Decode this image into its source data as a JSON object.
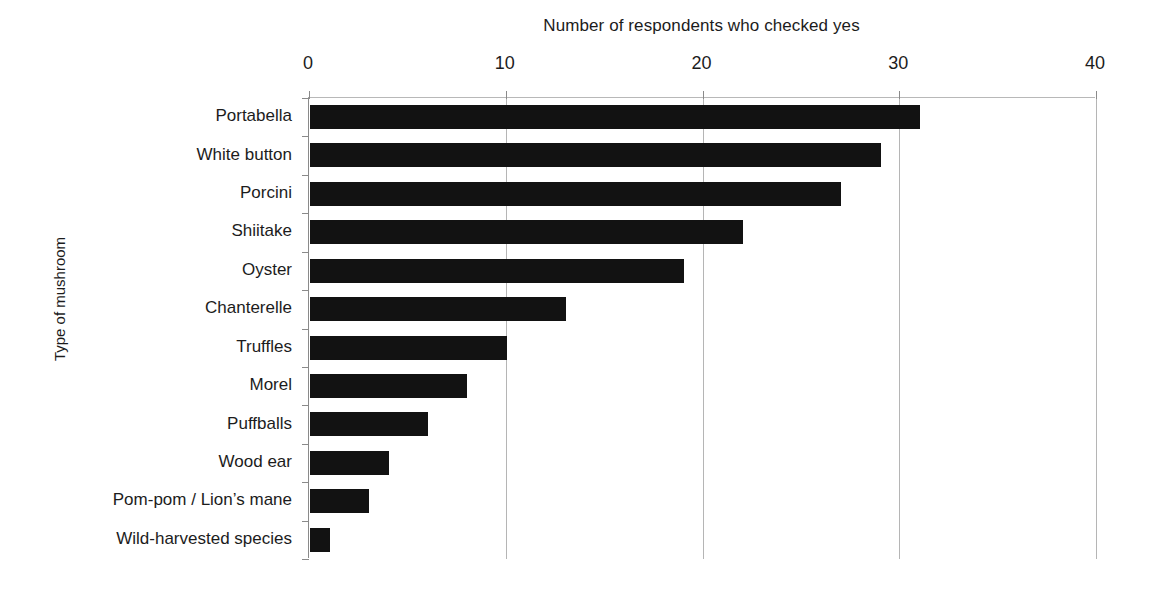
{
  "chart_data": {
    "type": "bar",
    "orientation": "horizontal",
    "title": "Number of respondents who checked yes",
    "xlabel": "Number of respondents who checked yes",
    "ylabel": "Type of mushroom",
    "xlim": [
      0,
      40
    ],
    "xticks": [
      0,
      10,
      20,
      30,
      40
    ],
    "xtick_labels": [
      "0",
      "10",
      "20",
      "30",
      "40"
    ],
    "grid": true,
    "grid_axis": "x",
    "legend": null,
    "bar_color": "#121212",
    "background_color": "#ffffff",
    "categories": [
      "Portabella",
      "White button",
      "Porcini",
      "Shiitake",
      "Oyster",
      "Chanterelle",
      "Truffles",
      "Morel",
      "Puffballs",
      "Wood ear",
      "Pom-pom / Lion’s mane",
      "Wild-harvested species"
    ],
    "values": [
      31,
      29,
      27,
      22,
      19,
      13,
      10,
      8,
      6,
      4,
      3,
      1
    ]
  },
  "axes": {
    "x_title": "Number of respondents who checked yes",
    "y_title": "Type of mushroom"
  }
}
